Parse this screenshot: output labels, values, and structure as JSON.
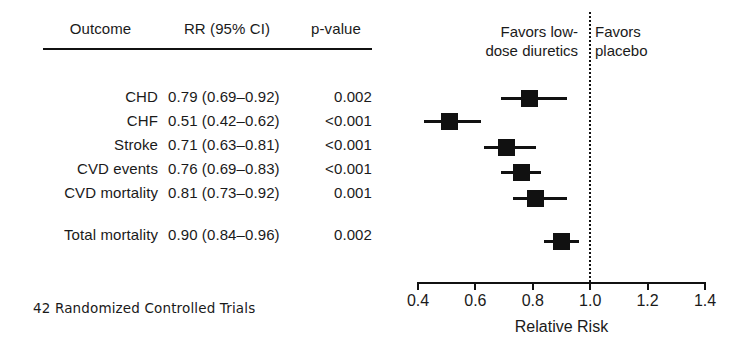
{
  "table": {
    "headers": {
      "outcome": "Outcome",
      "rr": "RR (95% CI)",
      "pvalue": "p-value"
    },
    "rows": [
      {
        "outcome": "CHD",
        "rr": "0.79 (0.69–0.92)",
        "pvalue": "0.002"
      },
      {
        "outcome": "CHF",
        "rr": "0.51 (0.42–0.62)",
        "pvalue": "<0.001"
      },
      {
        "outcome": "Stroke",
        "rr": "0.71 (0.63–0.81)",
        "pvalue": "<0.001"
      },
      {
        "outcome": "CVD events",
        "rr": "0.76 (0.69–0.83)",
        "pvalue": "<0.001"
      },
      {
        "outcome": "CVD mortality",
        "rr": "0.81 (0.73–0.92)",
        "pvalue": "0.001"
      },
      {
        "outcome": "Total mortality",
        "rr": "0.90 (0.84–0.96)",
        "pvalue": "0.002"
      }
    ],
    "footnote": "42 Randomized Controlled Trials"
  },
  "plot": {
    "favors_left": "Favors low-\ndose diuretics",
    "favors_left_line1": "Favors low-",
    "favors_left_line2": "dose diuretics",
    "favors_right_line1": "Favors",
    "favors_right_line2": "placebo",
    "null_value": 1.0,
    "axis_title": "Relative Risk",
    "tick_labels": [
      "0.4",
      "0.6",
      "0.8",
      "1.0",
      "1.2",
      "1.4"
    ],
    "marker_color": "#111111"
  },
  "chart_data": {
    "type": "forest",
    "title": "",
    "xlabel": "Relative Risk",
    "ylabel": "",
    "xlim": [
      0.4,
      1.4
    ],
    "xticks": [
      0.4,
      0.6,
      0.8,
      1.0,
      1.2,
      1.4
    ],
    "xtick_labels": [
      "0.4",
      "0.6",
      "0.8",
      "1.0",
      "1.2",
      "1.4"
    ],
    "log_scale": false,
    "grid": false,
    "reference_line": 1.0,
    "reference_line_style": "dotted",
    "legend": {
      "position": "top",
      "entries": [
        "Favors low-dose diuretics",
        "Favors placebo"
      ]
    },
    "annotations": [
      "42 Randomized Controlled Trials"
    ],
    "categories": [
      "CHD",
      "CHF",
      "Stroke",
      "CVD events",
      "CVD mortality",
      "Total mortality"
    ],
    "values": [
      0.79,
      0.51,
      0.71,
      0.76,
      0.81,
      0.9
    ],
    "ci_low": [
      0.69,
      0.42,
      0.63,
      0.69,
      0.73,
      0.84
    ],
    "ci_high": [
      0.92,
      0.62,
      0.81,
      0.83,
      0.92,
      0.96
    ],
    "p_values": [
      "0.002",
      "<0.001",
      "<0.001",
      "<0.001",
      "0.001",
      "0.002"
    ],
    "series": [
      {
        "name": "Relative Risk (95% CI)",
        "points": [
          {
            "label": "CHD",
            "rr": 0.79,
            "low": 0.69,
            "high": 0.92,
            "p": "0.002",
            "row_y": 98
          },
          {
            "label": "CHF",
            "rr": 0.51,
            "low": 0.42,
            "high": 0.62,
            "p": "<0.001",
            "row_y": 121
          },
          {
            "label": "Stroke",
            "rr": 0.71,
            "low": 0.63,
            "high": 0.81,
            "p": "<0.001",
            "row_y": 147
          },
          {
            "label": "CVD events",
            "rr": 0.76,
            "low": 0.69,
            "high": 0.83,
            "p": "<0.001",
            "row_y": 172
          },
          {
            "label": "CVD mortality",
            "rr": 0.81,
            "low": 0.73,
            "high": 0.92,
            "p": "0.001",
            "row_y": 198
          },
          {
            "label": "Total mortality",
            "rr": 0.9,
            "low": 0.84,
            "high": 0.96,
            "p": "0.002",
            "row_y": 241
          }
        ]
      }
    ]
  }
}
